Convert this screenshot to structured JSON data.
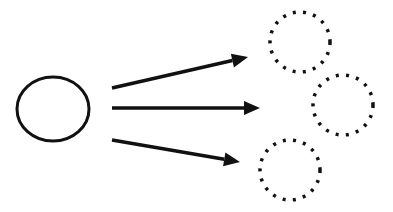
{
  "diagram": {
    "colors": {
      "stroke": "#111111",
      "background": "#ffffff"
    },
    "source": {
      "shape": "solid-ellipse",
      "cx": 53,
      "cy": 109,
      "rx": 36,
      "ry": 32
    },
    "arrows": [
      {
        "x1": 112,
        "y1": 88,
        "x2": 248,
        "y2": 57
      },
      {
        "x1": 112,
        "y1": 108,
        "x2": 260,
        "y2": 108
      },
      {
        "x1": 112,
        "y1": 140,
        "x2": 240,
        "y2": 162
      }
    ],
    "targets": [
      {
        "shape": "dotted-circle",
        "cx": 300,
        "cy": 42,
        "r": 30
      },
      {
        "shape": "dotted-circle",
        "cx": 343,
        "cy": 105,
        "r": 30
      },
      {
        "shape": "dotted-circle",
        "cx": 290,
        "cy": 170,
        "r": 30
      }
    ]
  }
}
